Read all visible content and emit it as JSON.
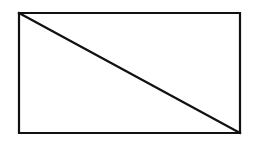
{
  "figure": {
    "name": "rectangle-with-diagonal",
    "background_color": "#ffffff",
    "stroke_color": "#111111",
    "fill_color": "#ffffff",
    "stroke_width": 2.2,
    "canvas": {
      "width": 255,
      "height": 147
    },
    "rectangle": {
      "x": 19,
      "y": 13,
      "width": 221,
      "height": 120,
      "corners": {
        "top_left": [
          19,
          13
        ],
        "top_right": [
          240,
          13
        ],
        "bottom_right": [
          240,
          133
        ],
        "bottom_left": [
          19,
          133
        ]
      },
      "outline_points": "19,13 240,13 240,133 19,133"
    },
    "diagonal": {
      "from": [
        19,
        13
      ],
      "to": [
        240,
        133
      ],
      "from_vertex": "top_left",
      "to_vertex": "bottom_right"
    },
    "labels": [],
    "annotations": []
  }
}
